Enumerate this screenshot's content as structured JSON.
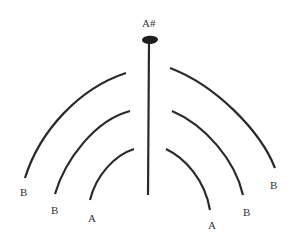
{
  "diagram": {
    "colors": {
      "stroke": "#2a2a2a",
      "label": "#333333",
      "background": "#ffffff"
    },
    "top_label": "A#",
    "left_labels": {
      "outer": "B",
      "middle": "B",
      "inner": "A"
    },
    "right_labels": {
      "outer": "B",
      "middle": "B",
      "inner": "A"
    }
  }
}
